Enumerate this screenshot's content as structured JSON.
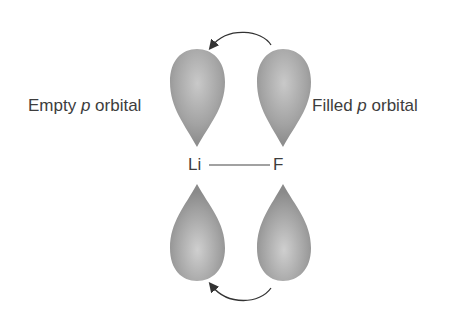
{
  "labels": {
    "left_pre": "Empty ",
    "left_p": "p",
    "left_post": " orbital",
    "right_pre": "Filled ",
    "right_p": "p",
    "right_post": " orbital"
  },
  "atoms": {
    "left": "Li",
    "right": "F"
  },
  "colors": {
    "lobe": "#9a9a9a",
    "lobe_highlight": "#c8c8c8",
    "arrow": "#333333",
    "bond": "#444444"
  }
}
